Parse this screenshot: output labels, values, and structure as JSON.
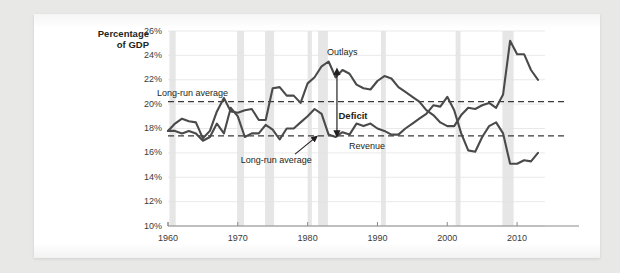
{
  "chart_data": {
    "type": "line",
    "title": "",
    "xlabel": "",
    "ylabel": "Percentage\nof GDP",
    "xlim": [
      1960,
      2014
    ],
    "ylim": [
      10,
      26
    ],
    "yticks": [
      "10%",
      "12%",
      "14%",
      "16%",
      "18%",
      "20%",
      "22%",
      "24%",
      "26%"
    ],
    "ytick_values": [
      10,
      12,
      14,
      16,
      18,
      20,
      22,
      24,
      26
    ],
    "xticks": [
      "1960",
      "1970",
      "1980",
      "1990",
      "2000",
      "2010"
    ],
    "xtick_values": [
      1960,
      1970,
      1980,
      1990,
      2000,
      2010
    ],
    "grid": "horizontal",
    "legend": "inline-annotations",
    "series": [
      {
        "name": "Outlays",
        "color": "#4a4a4a",
        "x": [
          1960,
          1961,
          1962,
          1963,
          1964,
          1965,
          1966,
          1967,
          1968,
          1969,
          1970,
          1971,
          1972,
          1973,
          1974,
          1975,
          1976,
          1977,
          1978,
          1979,
          1980,
          1981,
          1982,
          1983,
          1984,
          1985,
          1986,
          1987,
          1988,
          1989,
          1990,
          1991,
          1992,
          1993,
          1994,
          1995,
          1996,
          1997,
          1998,
          1999,
          2000,
          2001,
          2002,
          2003,
          2004,
          2005,
          2006,
          2007,
          2008,
          2009,
          2010,
          2011,
          2012,
          2013
        ],
        "values": [
          17.8,
          18.4,
          18.8,
          18.6,
          18.5,
          17.2,
          17.8,
          19.4,
          20.5,
          19.4,
          19.3,
          19.5,
          19.6,
          18.7,
          18.7,
          21.3,
          21.4,
          20.7,
          20.7,
          20.1,
          21.7,
          22.2,
          23.1,
          23.5,
          22.2,
          22.8,
          22.5,
          21.6,
          21.3,
          21.2,
          21.9,
          22.3,
          22.1,
          21.4,
          21.0,
          20.6,
          20.2,
          19.5,
          19.1,
          18.5,
          18.2,
          18.2,
          19.1,
          19.7,
          19.6,
          19.9,
          20.1,
          19.7,
          20.8,
          25.2,
          24.1,
          24.1,
          22.8,
          22.0
        ]
      },
      {
        "name": "Revenue",
        "color": "#4a4a4a",
        "x": [
          1960,
          1961,
          1962,
          1963,
          1964,
          1965,
          1966,
          1967,
          1968,
          1969,
          1970,
          1971,
          1972,
          1973,
          1974,
          1975,
          1976,
          1977,
          1978,
          1979,
          1980,
          1981,
          1982,
          1983,
          1984,
          1985,
          1986,
          1987,
          1988,
          1989,
          1990,
          1991,
          1992,
          1993,
          1994,
          1995,
          1996,
          1997,
          1998,
          1999,
          2000,
          2001,
          2002,
          2003,
          2004,
          2005,
          2006,
          2007,
          2008,
          2009,
          2010,
          2011,
          2012,
          2013
        ],
        "values": [
          17.8,
          17.8,
          17.6,
          17.8,
          17.6,
          17.0,
          17.3,
          18.4,
          17.6,
          19.7,
          19.0,
          17.3,
          17.6,
          17.6,
          18.3,
          17.9,
          17.1,
          18.0,
          18.0,
          18.5,
          19.0,
          19.6,
          19.2,
          17.5,
          17.3,
          17.7,
          17.5,
          18.4,
          18.2,
          18.4,
          18.0,
          17.8,
          17.5,
          17.5,
          18.0,
          18.4,
          18.8,
          19.2,
          19.9,
          19.8,
          20.6,
          19.5,
          17.6,
          16.2,
          16.1,
          17.3,
          18.2,
          18.5,
          17.6,
          15.1,
          15.1,
          15.4,
          15.3,
          16.0
        ]
      }
    ],
    "reference_lines": [
      {
        "label": "Long-run average",
        "value": 20.2,
        "series": "Outlays",
        "style": "dashed"
      },
      {
        "label": "Long-run average",
        "value": 17.4,
        "series": "Revenue",
        "style": "dashed"
      }
    ],
    "annotations": [
      {
        "text": "Outlays",
        "x": 1985,
        "y": 24.3
      },
      {
        "text": "Revenue",
        "x": 1988.5,
        "y": 16.6
      },
      {
        "text": "Deficit",
        "x": 1986.5,
        "y": 19.0
      },
      {
        "text": "Long-run average",
        "x": 1963.5,
        "y": 20.9
      },
      {
        "text": "Long-run average",
        "x": 1975.5,
        "y": 15.4
      }
    ],
    "shaded_bands": {
      "name": "recession-bands",
      "color": "#e6e6e6",
      "ranges": [
        [
          1960.2,
          1961.1
        ],
        [
          1969.9,
          1970.9
        ],
        [
          1973.9,
          1975.2
        ],
        [
          1980.0,
          1980.6
        ],
        [
          1981.5,
          1982.9
        ],
        [
          1990.5,
          1991.2
        ],
        [
          2001.2,
          2001.9
        ],
        [
          2007.9,
          2009.5
        ]
      ]
    }
  },
  "axis": {
    "ylabel_line1": "Percentage",
    "ylabel_line2": "of GDP"
  },
  "colors": {
    "page": "#ffffff",
    "background": "#e8e8e6",
    "line": "#4a4a4a",
    "band": "#e6e6e6",
    "grid": "#e3e3e3",
    "text": "#231f20"
  }
}
